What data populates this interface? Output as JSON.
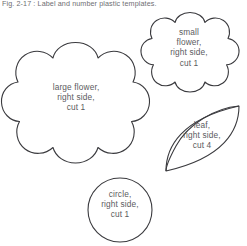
{
  "figure": {
    "caption": "Fig. 2-17 : Label and number plastic templates.",
    "line_color": "#3a3a3e",
    "text_color": "#5b5b60",
    "background_color": "#ffffff"
  },
  "shapes": [
    {
      "id": "large-flower",
      "name": "large-flower-template",
      "kind": "scalloped-flower",
      "lobes": 8,
      "label": "large flower,\nright side,\ncut 1",
      "piece": "large flower",
      "side": "right side",
      "quantity": "cut 1"
    },
    {
      "id": "small-flower",
      "name": "small-flower-template",
      "kind": "scalloped-flower",
      "lobes": 8,
      "label": "small\nflower,\nright side,\ncut 1",
      "piece": "small flower",
      "side": "right side",
      "quantity": "cut 1"
    },
    {
      "id": "leaf",
      "name": "leaf-template",
      "kind": "pointed-oval",
      "label": "leaf,\nright side,\ncut 4",
      "piece": "leaf",
      "side": "right side",
      "quantity": "cut 4"
    },
    {
      "id": "circle",
      "name": "circle-template",
      "kind": "circle",
      "label": "circle,\nright side,\ncut 1",
      "piece": "circle",
      "side": "right side",
      "quantity": "cut 1"
    }
  ]
}
